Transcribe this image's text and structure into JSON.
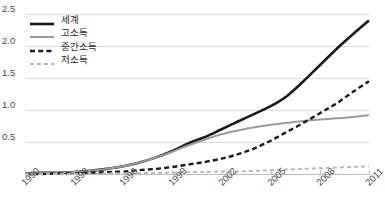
{
  "chart_data": {
    "type": "line",
    "title": "",
    "subtitle": "",
    "xlabel": "",
    "ylabel": "",
    "xlim": [
      1990,
      2011
    ],
    "ylim": [
      0,
      2.6
    ],
    "grid": true,
    "legend_position": "top-left",
    "x_tick_labels": [
      "1990",
      "1993",
      "1996",
      "1999",
      "2002",
      "2005",
      "2008",
      "2011"
    ],
    "x_tick_values": [
      1990,
      1993,
      1996,
      1999,
      2002,
      2005,
      2008,
      2011
    ],
    "y_tick_labels": [
      "0.5",
      "1.0",
      "1.5",
      "2.0",
      "2.5"
    ],
    "y_tick_values": [
      0.5,
      1.0,
      1.5,
      2.0,
      2.5
    ],
    "x": [
      1990,
      1991,
      1992,
      1993,
      1994,
      1995,
      1996,
      1997,
      1998,
      1999,
      2000,
      2001,
      2002,
      2003,
      2004,
      2005,
      2006,
      2007,
      2008,
      2009,
      2010,
      2011
    ],
    "series": [
      {
        "name": "세계",
        "color": "#1a1a1a",
        "style": "solid",
        "width": 2.6,
        "values": [
          0.01,
          0.02,
          0.02,
          0.03,
          0.05,
          0.08,
          0.12,
          0.18,
          0.26,
          0.36,
          0.48,
          0.58,
          0.7,
          0.82,
          0.94,
          1.06,
          1.22,
          1.45,
          1.7,
          1.95,
          2.18,
          2.4
        ]
      },
      {
        "name": "고소득",
        "color": "#9b9b9b",
        "style": "solid",
        "width": 2.0,
        "values": [
          0.01,
          0.02,
          0.02,
          0.03,
          0.05,
          0.08,
          0.12,
          0.18,
          0.26,
          0.35,
          0.45,
          0.54,
          0.62,
          0.68,
          0.73,
          0.77,
          0.8,
          0.83,
          0.85,
          0.87,
          0.89,
          0.92
        ]
      },
      {
        "name": "중간소득",
        "color": "#1a1a1a",
        "style": "dashed",
        "width": 2.4,
        "values": [
          0.0,
          0.0,
          0.01,
          0.01,
          0.02,
          0.03,
          0.04,
          0.06,
          0.08,
          0.11,
          0.15,
          0.19,
          0.24,
          0.31,
          0.4,
          0.52,
          0.66,
          0.8,
          0.95,
          1.1,
          1.28,
          1.45
        ]
      },
      {
        "name": "저소득",
        "color": "#b5b5b5",
        "style": "dashed",
        "width": 1.9,
        "values": [
          0.0,
          0.0,
          0.0,
          0.0,
          0.0,
          0.01,
          0.01,
          0.01,
          0.02,
          0.02,
          0.03,
          0.03,
          0.04,
          0.04,
          0.05,
          0.06,
          0.07,
          0.08,
          0.09,
          0.1,
          0.11,
          0.12
        ]
      }
    ]
  }
}
